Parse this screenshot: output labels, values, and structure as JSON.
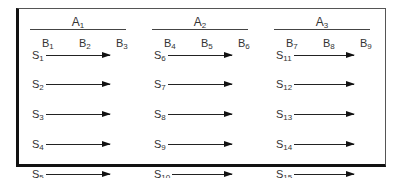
{
  "groups": [
    {
      "label": "A",
      "sub": "1",
      "x": 30,
      "linew": 96,
      "columns": [
        {
          "label": "B",
          "sub": "1"
        },
        {
          "label": "B",
          "sub": "2"
        },
        {
          "label": "B",
          "sub": "3"
        }
      ],
      "rows": [
        {
          "label": "S",
          "sub": "1"
        },
        {
          "label": "S",
          "sub": "2"
        },
        {
          "label": "S",
          "sub": "3"
        },
        {
          "label": "S",
          "sub": "4"
        },
        {
          "label": "S",
          "sub": "5"
        }
      ]
    },
    {
      "label": "A",
      "sub": "2",
      "x": 152,
      "linew": 96,
      "columns": [
        {
          "label": "B",
          "sub": "4"
        },
        {
          "label": "B",
          "sub": "5"
        },
        {
          "label": "B",
          "sub": "6"
        }
      ],
      "rows": [
        {
          "label": "S",
          "sub": "6"
        },
        {
          "label": "S",
          "sub": "7"
        },
        {
          "label": "S",
          "sub": "8"
        },
        {
          "label": "S",
          "sub": "9"
        },
        {
          "label": "S",
          "sub": "10"
        }
      ]
    },
    {
      "label": "A",
      "sub": "3",
      "x": 274,
      "linew": 96,
      "columns": [
        {
          "label": "B",
          "sub": "7"
        },
        {
          "label": "B",
          "sub": "8"
        },
        {
          "label": "B",
          "sub": "9"
        }
      ],
      "rows": [
        {
          "label": "S",
          "sub": "11"
        },
        {
          "label": "S",
          "sub": "12"
        },
        {
          "label": "S",
          "sub": "13"
        },
        {
          "label": "S",
          "sub": "14"
        },
        {
          "label": "S",
          "sub": "15"
        }
      ]
    }
  ]
}
